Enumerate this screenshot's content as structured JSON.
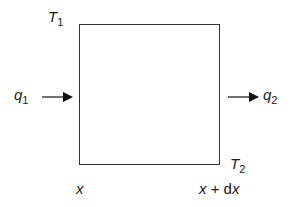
{
  "diagram": {
    "labels": {
      "t1": {
        "base": "T",
        "sub": "1"
      },
      "t2": {
        "base": "T",
        "sub": "2"
      },
      "q1": {
        "base": "q",
        "sub": "1"
      },
      "q2": {
        "base": "q",
        "sub": "2"
      },
      "x_left": "x",
      "x_right": {
        "x": "x",
        "plus": " + ",
        "d": "d",
        "x2": "x"
      }
    },
    "colors": {
      "line": "#333333",
      "text": "#1a1a1a"
    }
  }
}
